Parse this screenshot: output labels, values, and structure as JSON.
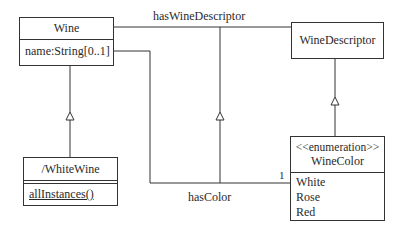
{
  "diagram": {
    "type": "UML class diagram",
    "classes": {
      "wine": {
        "name": "Wine",
        "attributes": [
          "name:String[0..1]"
        ]
      },
      "white_wine": {
        "name": "/WhiteWine",
        "operations": [
          "allInstances()"
        ]
      },
      "wine_descriptor": {
        "name": "WineDescriptor"
      },
      "wine_color": {
        "stereotype": "<<enumeration>>",
        "name": "WineColor",
        "literals": [
          "White",
          "Rose",
          "Red"
        ]
      }
    },
    "associations": {
      "has_wine_descriptor": {
        "label": "hasWineDescriptor",
        "from": "Wine",
        "to": "WineDescriptor"
      },
      "has_color": {
        "label": "hasColor",
        "from": "Wine",
        "to": "WineColor",
        "multiplicity": "1"
      }
    },
    "generalizations": [
      {
        "child": "/WhiteWine",
        "parent": "Wine"
      },
      {
        "child": "WineColor",
        "parent": "WineDescriptor"
      },
      {
        "child": "hasColor",
        "parent": "hasWineDescriptor"
      }
    ],
    "colors": {
      "line": "#333333",
      "text": "#2a2a2a",
      "background": "#ffffff"
    }
  }
}
